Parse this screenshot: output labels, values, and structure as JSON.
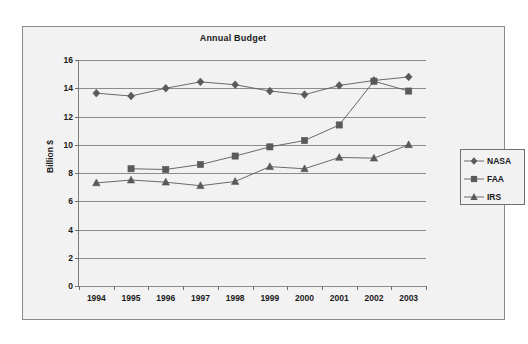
{
  "chart_data": {
    "type": "line",
    "title": "Annual Budget",
    "xlabel": "",
    "ylabel": "Billion $",
    "categories": [
      "1994",
      "1995",
      "1996",
      "1997",
      "1998",
      "1999",
      "2000",
      "2001",
      "2002",
      "2003"
    ],
    "ylim": [
      0,
      16
    ],
    "ytick_step": 2,
    "yticks": [
      "16",
      "14",
      "12",
      "10",
      "8",
      "6",
      "4",
      "2",
      "0"
    ],
    "grid": true,
    "legend_position": "right",
    "series": [
      {
        "name": "NASA",
        "marker": "diamond",
        "color": "#5a5a5a",
        "values": [
          13.65,
          13.45,
          14.0,
          14.45,
          14.25,
          13.8,
          13.55,
          14.2,
          14.55,
          14.8
        ]
      },
      {
        "name": "FAA",
        "marker": "square",
        "color": "#5a5a5a",
        "values": [
          null,
          8.3,
          8.25,
          8.6,
          9.2,
          9.85,
          10.3,
          11.4,
          14.5,
          13.8
        ]
      },
      {
        "name": "IRS",
        "marker": "triangle",
        "color": "#5a5a5a",
        "values": [
          7.3,
          7.5,
          7.35,
          7.1,
          7.4,
          8.45,
          8.3,
          9.1,
          9.05,
          10.0
        ]
      }
    ]
  },
  "legend": {
    "entries": [
      {
        "label": "NASA"
      },
      {
        "label": "FAA"
      },
      {
        "label": "IRS"
      }
    ]
  },
  "colors": {
    "frame_border": "#8a8a8a",
    "plot_background": "#f2f2f2",
    "gridline": "#8d8d8d",
    "series_line": "#5a5a5a",
    "text": "#1a1a1a"
  }
}
